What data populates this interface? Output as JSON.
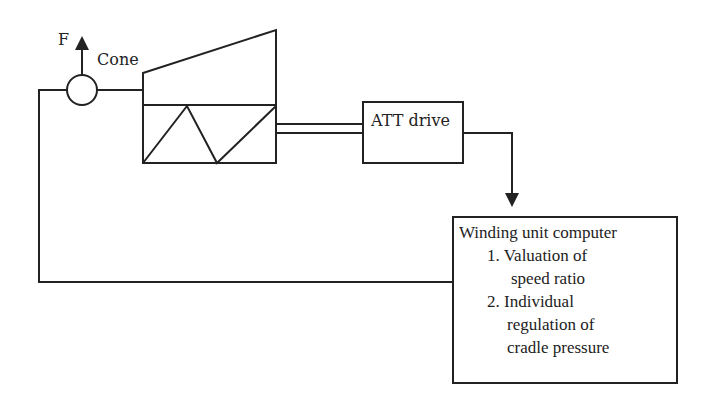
{
  "labels": {
    "force": "F",
    "cone": "Cone",
    "att_drive": "ATT drive",
    "computer_title": "Winding unit computer",
    "item1_line1": "1. Valuation of",
    "item1_line2": "speed ratio",
    "item2_line1": "2. Individual",
    "item2_line2": "regulation of",
    "item2_line3": "cradle pressure"
  },
  "colors": {
    "stroke": "#222222",
    "background": "#ffffff"
  }
}
